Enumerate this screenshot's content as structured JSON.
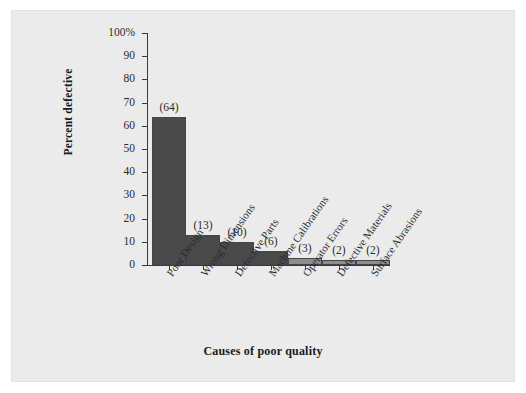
{
  "chart_data": {
    "type": "bar",
    "title": "",
    "subtitle": "",
    "xlabel": "Causes of poor quality",
    "ylabel": "Percent defective",
    "categories": [
      "Poor Design",
      "Wrong Dimensions",
      "Defective Parts",
      "Machine Calibrations",
      "Operator Errors",
      "Defective Materials",
      "Surface Abrasions"
    ],
    "values": [
      64,
      13,
      10,
      6,
      3,
      2,
      2
    ],
    "data_labels": [
      "(64)",
      "(13)",
      "(10)",
      "(6)",
      "(3)",
      "(2)",
      "(2)"
    ],
    "bar_colors": [
      "#4a4a4a",
      "#4a4a4a",
      "#4a4a4a",
      "#4a4a4a",
      "#8e8e8e",
      "#8e8e8e",
      "#8e8e8e"
    ],
    "bar_border_color": "#46464a",
    "ylim": [
      0,
      100
    ],
    "ytick_values": [
      0,
      10,
      20,
      30,
      40,
      50,
      60,
      70,
      80,
      90,
      100
    ],
    "ytick_labels": [
      "0",
      "10",
      "20",
      "30",
      "40",
      "50",
      "60",
      "70",
      "80",
      "90",
      "100%"
    ],
    "grid": false,
    "legend": false,
    "legend_position": "none",
    "panel_color": "#ebebeb",
    "axis_color": "#3a3a3a",
    "category_label_rotation": -55
  }
}
